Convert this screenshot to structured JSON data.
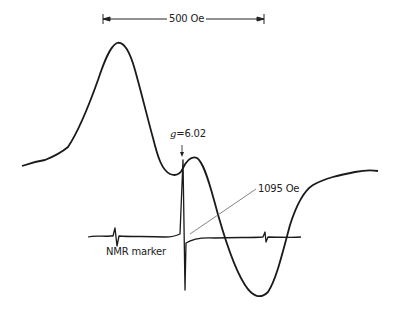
{
  "figure": {
    "type": "EPR spectrum",
    "scale_bar": {
      "label": "500 Oe"
    },
    "annotations": {
      "g_value_label": "g=6.02",
      "g_symbol": "g",
      "g_value": "=6.02",
      "marker_field_label": "1095 Oe",
      "nmr_marker_label": "NMR marker"
    },
    "colors": {
      "trace": "#1a1a1a",
      "leader": "#666666",
      "background": "#ffffff"
    }
  }
}
